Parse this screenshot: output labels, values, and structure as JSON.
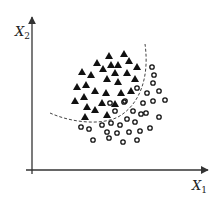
{
  "diagram": {
    "type": "scatter-classification",
    "x_axis": {
      "label": "X",
      "subscript": "1"
    },
    "y_axis": {
      "label": "X",
      "subscript": "2"
    },
    "colors": {
      "axis": "#333333",
      "marker": "#111111",
      "boundary": "#444444"
    },
    "classes": [
      {
        "name": "class-triangle",
        "marker": "filled-triangle",
        "points": [
          [
            109,
            56
          ],
          [
            124,
            54
          ],
          [
            97,
            63
          ],
          [
            111,
            65
          ],
          [
            118,
            65
          ],
          [
            129,
            61
          ],
          [
            82,
            72
          ],
          [
            91,
            75
          ],
          [
            103,
            69
          ],
          [
            115,
            73
          ],
          [
            127,
            73
          ],
          [
            137,
            67
          ],
          [
            107,
            79
          ],
          [
            118,
            82
          ],
          [
            135,
            79
          ],
          [
            77,
            87
          ],
          [
            86,
            85
          ],
          [
            95,
            91
          ],
          [
            106,
            93
          ],
          [
            121,
            93
          ],
          [
            131,
            91
          ],
          [
            75,
            101
          ],
          [
            84,
            97
          ],
          [
            102,
            103
          ],
          [
            115,
            104
          ],
          [
            87,
            107
          ],
          [
            95,
            110
          ],
          [
            107,
            115
          ],
          [
            85,
            117
          ]
        ]
      },
      {
        "name": "class-circle",
        "marker": "open-circle",
        "points": [
          [
            152,
            67
          ],
          [
            154,
            75
          ],
          [
            153,
            83
          ],
          [
            137,
            88
          ],
          [
            147,
            93
          ],
          [
            159,
            91
          ],
          [
            125,
            101
          ],
          [
            143,
            103
          ],
          [
            153,
            101
          ],
          [
            165,
            100
          ],
          [
            110,
            103
          ],
          [
            124,
            102
          ],
          [
            115,
            111
          ],
          [
            133,
            111
          ],
          [
            141,
            114
          ],
          [
            146,
            113
          ],
          [
            159,
            117
          ],
          [
            127,
            119
          ],
          [
            135,
            122
          ],
          [
            81,
            127
          ],
          [
            89,
            129
          ],
          [
            102,
            125
          ],
          [
            111,
            123
          ],
          [
            120,
            125
          ],
          [
            107,
            132
          ],
          [
            117,
            133
          ],
          [
            129,
            132
          ],
          [
            140,
            131
          ],
          [
            150,
            128
          ],
          [
            93,
            140
          ],
          [
            109,
            138
          ],
          [
            123,
            142
          ],
          [
            137,
            140
          ]
        ]
      }
    ],
    "decision_boundary": {
      "style": "dashed",
      "path": "M50,113 C70,122 100,126 118,117 C138,106 150,80 145,44"
    }
  }
}
